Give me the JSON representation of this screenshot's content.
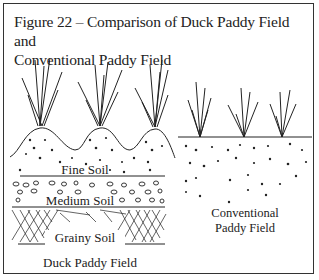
{
  "figure": {
    "title_line1": "Figure 22 – Comparison of Duck Paddy Field and",
    "title_line2": "Conventional Paddy Field"
  },
  "duck_paddy": {
    "layers": [
      "Fine Soil",
      "Medium Soil",
      "Grainy Soil"
    ],
    "caption": "Duck Paddy Field"
  },
  "conventional_paddy": {
    "caption_line1": "Conventional",
    "caption_line2": "Paddy Field"
  }
}
